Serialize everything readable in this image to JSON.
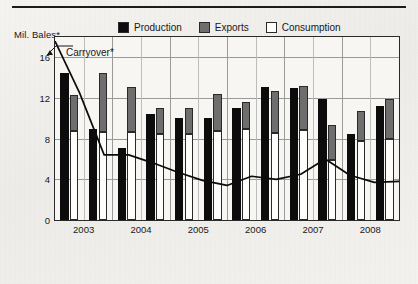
{
  "chart_data": {
    "type": "bar",
    "title": "",
    "ylabel": "Mil. Bales*",
    "xlabel": "",
    "ylim": [
      0,
      18
    ],
    "yticks": [
      0,
      4,
      8,
      12,
      16
    ],
    "ytick_labels": [
      "0",
      "4",
      "8",
      "12",
      "16"
    ],
    "grid": true,
    "legend_position": "top-center",
    "year_labels": [
      "2003",
      "2004",
      "2005",
      "2006",
      "2007",
      "2008"
    ],
    "periods_per_year": 2,
    "categories": [
      "2003 H1",
      "2003 H2",
      "2004 H1",
      "2004 H2",
      "2005 H1",
      "2005 H2",
      "2006 H1",
      "2006 H2",
      "2007 H1",
      "2007 H2",
      "2008 H1",
      "2008 H2"
    ],
    "series": [
      {
        "name": "Production",
        "color": "#0c0c0c",
        "values": [
          14.5,
          9.0,
          7.1,
          10.4,
          10.0,
          10.0,
          11.0,
          13.1,
          13.0,
          11.9,
          8.5,
          11.2
        ]
      },
      {
        "name": "Exports",
        "color": "#6e6e6e",
        "values": [
          12.3,
          14.5,
          13.1,
          11.0,
          11.0,
          12.4,
          11.6,
          12.7,
          13.2,
          9.3,
          10.7,
          11.9
        ]
      },
      {
        "name": "Consumption",
        "color": "#fdfdfb",
        "values": [
          8.8,
          8.7,
          8.7,
          8.5,
          8.5,
          8.8,
          9.0,
          8.6,
          8.9,
          5.9,
          7.8,
          8.0
        ]
      }
    ],
    "overlay_line": {
      "name": "Carryover*",
      "color": "#0c0c0c",
      "annotation": "Carryover*",
      "values": [
        17.6,
        12.5,
        6.4,
        6.4,
        5.6,
        4.7,
        3.9,
        3.4,
        4.3,
        4.0,
        4.5,
        6.0,
        4.4,
        3.7,
        3.8
      ]
    }
  },
  "legend": {
    "items": [
      {
        "label": "Production",
        "swatch": "production-swatch"
      },
      {
        "label": "Exports",
        "swatch": "exports-swatch"
      },
      {
        "label": "Consumption",
        "swatch": "consumption-swatch"
      }
    ]
  },
  "annotations": {
    "axis_title": "Mil. Bales*",
    "carryover": "Carryover*"
  }
}
